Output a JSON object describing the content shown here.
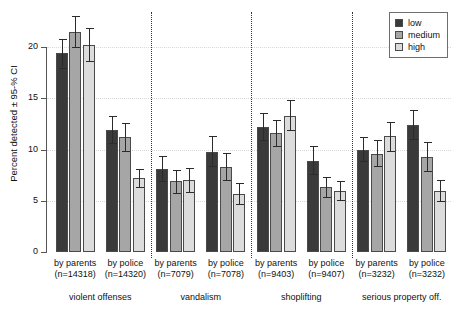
{
  "chart_data": {
    "type": "bar",
    "title": "",
    "subtitle": "",
    "xlabel": "",
    "ylabel": "Percent detected ± 95-% CI",
    "ylim": [
      0,
      22.5
    ],
    "yticks": [
      0,
      5,
      10,
      15,
      20
    ],
    "ytick_labels": [
      "0",
      "5",
      "10",
      "15",
      "20"
    ],
    "grid": "horizontal dotted gridlines at y tick values",
    "legend": {
      "position": "top-right",
      "entries": [
        {
          "name": "low",
          "color": "#3a3a3a"
        },
        {
          "name": "medium",
          "color": "#a6a6a6"
        },
        {
          "name": "high",
          "color": "#dcdcdc"
        }
      ]
    },
    "series": [
      {
        "name": "low",
        "values": [
          19.4,
          11.9,
          8.1,
          9.8,
          12.2,
          8.9,
          10.0,
          12.4
        ]
      },
      {
        "name": "medium",
        "values": [
          21.5,
          11.2,
          6.9,
          8.3,
          11.6,
          6.3,
          9.6,
          9.3
        ]
      },
      {
        "name": "high",
        "values": [
          20.2,
          7.2,
          7.0,
          5.7,
          13.3,
          6.0,
          11.3,
          6.0
        ]
      }
    ],
    "error_low": [
      [
        18.0,
        10.6,
        6.9,
        8.4,
        10.9,
        7.6,
        8.9,
        11.0
      ],
      [
        20.0,
        9.9,
        5.8,
        7.0,
        10.3,
        5.4,
        8.4,
        7.9
      ],
      [
        18.6,
        6.3,
        5.9,
        4.7,
        11.9,
        5.1,
        9.9,
        5.0
      ]
    ],
    "error_high": [
      [
        20.8,
        13.3,
        9.4,
        11.3,
        13.6,
        10.3,
        11.2,
        13.9
      ],
      [
        23.0,
        12.6,
        8.0,
        9.7,
        12.9,
        7.3,
        10.9,
        10.7
      ],
      [
        21.9,
        8.1,
        8.2,
        6.7,
        14.8,
        6.9,
        12.7,
        7.0
      ]
    ],
    "categories": [
      "by parents\n(n=14318)",
      "by police\n(n=14320)",
      "by parents\n(n=7079)",
      "by police\n(n=7078)",
      "by parents\n(n=9403)",
      "by police\n(n=9407)",
      "by parents\n(n=3232)",
      "by police\n(n=3232)"
    ],
    "groups": [
      {
        "label": "violent offenses",
        "members": [
          "by parents (n=14318)",
          "by police (n=14320)"
        ]
      },
      {
        "label": "vandalism",
        "members": [
          "by parents (n=7079)",
          "by police (n=7078)"
        ]
      },
      {
        "label": "shoplifting",
        "members": [
          "by parents (n=9403)",
          "by police (n=9407)"
        ]
      },
      {
        "label": "serious property off.",
        "members": [
          "by parents (n=3232)",
          "by police (n=3232)"
        ]
      }
    ]
  },
  "axis": {
    "y_title": "Percent detected ± 95-% CI",
    "y_labels": [
      "0",
      "5",
      "10",
      "15",
      "20"
    ]
  },
  "legend": {
    "items": [
      {
        "label": "low"
      },
      {
        "label": "medium"
      },
      {
        "label": "high"
      }
    ]
  },
  "xaxis": {
    "clusters": [
      {
        "line1": "by parents",
        "line2": "(n=14318)"
      },
      {
        "line1": "by police",
        "line2": "(n=14320)"
      },
      {
        "line1": "by parents",
        "line2": "(n=7079)"
      },
      {
        "line1": "by police",
        "line2": "(n=7078)"
      },
      {
        "line1": "by parents",
        "line2": "(n=9403)"
      },
      {
        "line1": "by police",
        "line2": "(n=9407)"
      },
      {
        "line1": "by parents",
        "line2": "(n=3232)"
      },
      {
        "line1": "by police",
        "line2": "(n=3232)"
      }
    ],
    "groups": [
      {
        "label": "violent offenses"
      },
      {
        "label": "vandalism"
      },
      {
        "label": "shoplifting"
      },
      {
        "label": "serious property off."
      }
    ]
  }
}
